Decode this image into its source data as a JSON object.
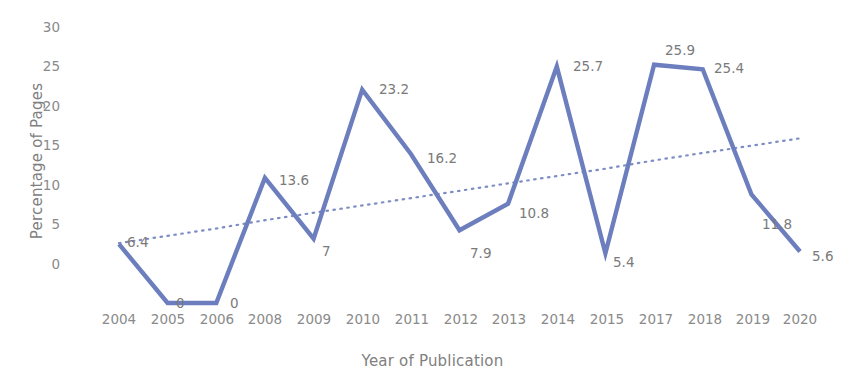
{
  "chart_data": {
    "type": "line",
    "title": "",
    "xlabel": "Year of Publication",
    "ylabel": "Percentage of Pages",
    "categories": [
      "2004",
      "2005",
      "2006",
      "2008",
      "2009",
      "2010",
      "2011",
      "2012",
      "2013",
      "2014",
      "2015",
      "2017",
      "2018",
      "2019",
      "2020"
    ],
    "values": [
      6.4,
      0,
      0,
      13.6,
      7,
      23.2,
      16.2,
      7.9,
      10.8,
      25.7,
      5.4,
      25.9,
      25.4,
      11.8,
      5.6
    ],
    "data_labels": [
      "6.4",
      "0",
      "0",
      "13.6",
      "7",
      "23.2",
      "16.2",
      "7.9",
      "10.8",
      "25.7",
      "5.4",
      "25.9",
      "25.4",
      "11.8",
      "5.6"
    ],
    "yticks": [
      "0",
      "5",
      "10",
      "15",
      "20",
      "25",
      "30"
    ],
    "ylim": [
      0,
      30
    ],
    "grid": false,
    "legend": "none",
    "series": [
      {
        "name": "Percentage of Pages",
        "style": "solid",
        "color": "#6c7ebd",
        "values": [
          6.4,
          0,
          0,
          13.6,
          7,
          23.2,
          16.2,
          7.9,
          10.8,
          25.7,
          5.4,
          25.9,
          25.4,
          11.8,
          5.6
        ]
      },
      {
        "name": "Linear trendline",
        "style": "dotted",
        "color": "#7e8dc4",
        "values": [
          6.5,
          7.3,
          8.1,
          9.0,
          9.8,
          10.6,
          11.4,
          12.2,
          13.0,
          13.8,
          14.6,
          15.5,
          16.3,
          17.1,
          17.9
        ]
      }
    ]
  },
  "colors": {
    "series": "#6c7ebd",
    "trend": "#7e8dc4",
    "text": "#808080",
    "background": "#ffffff"
  }
}
